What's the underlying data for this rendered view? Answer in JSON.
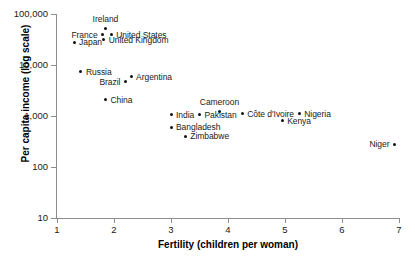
{
  "chart_data": {
    "type": "scatter",
    "title": "",
    "xlabel": "Fertility (children per woman)",
    "ylabel": "Per capita income (log scale)",
    "xlim": [
      1,
      7
    ],
    "ylim": [
      10,
      100000
    ],
    "yscale": "log",
    "grid": false,
    "legend": "none",
    "xticks": [
      {
        "value": 1,
        "label": "1"
      },
      {
        "value": 2,
        "label": "2"
      },
      {
        "value": 3,
        "label": "3"
      },
      {
        "value": 4,
        "label": "4"
      },
      {
        "value": 5,
        "label": "5"
      },
      {
        "value": 6,
        "label": "6"
      },
      {
        "value": 7,
        "label": "7"
      }
    ],
    "yticks": [
      {
        "value": 100000,
        "label": "100,000"
      },
      {
        "value": 10000,
        "label": "10,000"
      },
      {
        "value": 1000,
        "label": "1,000"
      },
      {
        "value": 100,
        "label": "100"
      },
      {
        "value": 10,
        "label": "10"
      }
    ],
    "points": [
      {
        "label": "Ireland",
        "x": 1.85,
        "y": 52000,
        "pos": "above"
      },
      {
        "label": "France",
        "x": 1.8,
        "y": 39000,
        "pos": "left"
      },
      {
        "label": "United States",
        "x": 1.95,
        "y": 39000,
        "pos": "right"
      },
      {
        "label": "United Kingdom",
        "x": 1.82,
        "y": 31000,
        "pos": "right"
      },
      {
        "label": "Japan",
        "x": 1.3,
        "y": 28000,
        "pos": "right"
      },
      {
        "label": "Russia",
        "x": 1.42,
        "y": 7400,
        "pos": "right"
      },
      {
        "label": "Argentina",
        "x": 2.3,
        "y": 5900,
        "pos": "right"
      },
      {
        "label": "Brazil",
        "x": 2.2,
        "y": 4700,
        "pos": "left"
      },
      {
        "label": "China",
        "x": 1.85,
        "y": 2100,
        "pos": "right"
      },
      {
        "label": "India",
        "x": 3.0,
        "y": 1050,
        "pos": "right"
      },
      {
        "label": "Pakistan",
        "x": 3.5,
        "y": 1050,
        "pos": "right"
      },
      {
        "label": "Cameroon",
        "x": 3.85,
        "y": 1250,
        "pos": "above"
      },
      {
        "label": "Côte d'Ivoire",
        "x": 4.25,
        "y": 1100,
        "pos": "right"
      },
      {
        "label": "Nigeria",
        "x": 5.25,
        "y": 1100,
        "pos": "right"
      },
      {
        "label": "Kenya",
        "x": 4.95,
        "y": 800,
        "pos": "right"
      },
      {
        "label": "Bangladesh",
        "x": 3.0,
        "y": 600,
        "pos": "right"
      },
      {
        "label": "Zimbabwe",
        "x": 3.25,
        "y": 400,
        "pos": "right"
      },
      {
        "label": "Niger",
        "x": 6.92,
        "y": 280,
        "pos": "left"
      }
    ]
  }
}
